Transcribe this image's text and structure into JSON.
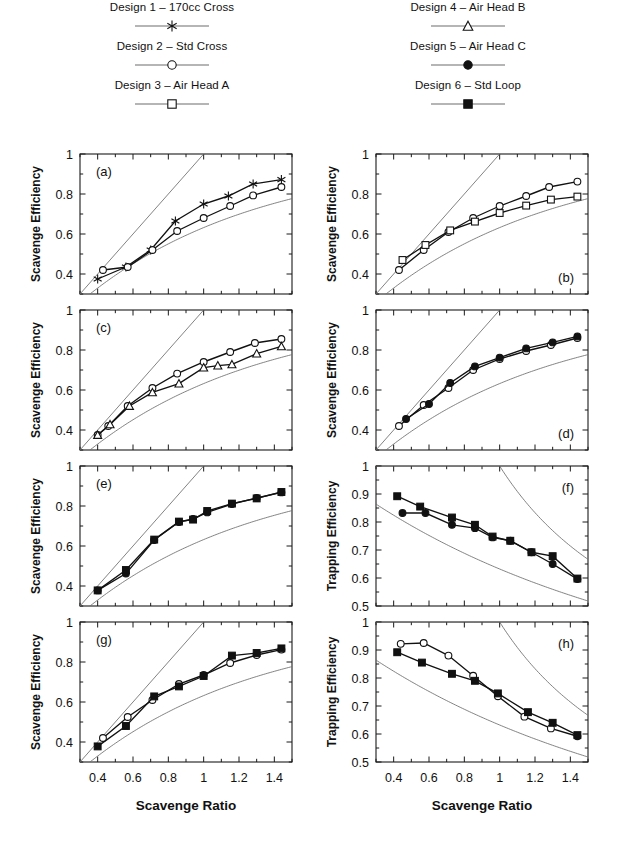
{
  "legend": {
    "left_entries": [
      {
        "label": "Design 1 – 170cc Cross",
        "marker": "star-icon"
      },
      {
        "label": "Design 2 – Std Cross",
        "marker": "open-circle-icon"
      },
      {
        "label": "Design 3 – Air Head A",
        "marker": "open-square-icon"
      }
    ],
    "right_entries": [
      {
        "label": "Design 4 – Air Head B",
        "marker": "open-triangle-icon"
      },
      {
        "label": "Design 5 – Air Head C",
        "marker": "filled-circle-icon"
      },
      {
        "label": "Design 6 – Std Loop",
        "marker": "filled-square-icon"
      }
    ]
  },
  "axes": {
    "x_title": "Scavenge Ratio",
    "y_title_scavenge": "Scavenge Efficiency",
    "y_title_trapping": "Trapping Efficiency",
    "x_ticklabels": [
      "0.4",
      "0.6",
      "0.8",
      "1",
      "1.2",
      "1.4"
    ],
    "x_tickvalues": [
      0.4,
      0.6,
      0.8,
      1.0,
      1.2,
      1.4
    ],
    "y_ticklabels_scavenge": [
      "0.4",
      "0.6",
      "0.8",
      "1"
    ],
    "y_tickvalues_scavenge": [
      0.4,
      0.6,
      0.8,
      1.0
    ],
    "y_ticklabels_trapping": [
      "0.5",
      "0.6",
      "0.7",
      "0.8",
      "0.9",
      "1"
    ],
    "y_tickvalues_trapping": [
      0.5,
      0.6,
      0.7,
      0.8,
      0.9,
      1.0
    ],
    "xlim": [
      0.3,
      1.5
    ],
    "ylim_scavenge": [
      0.3,
      1.0
    ],
    "ylim_trapping": [
      0.5,
      1.0
    ]
  },
  "colors": {
    "ink": "#111111",
    "reference_curve": "#6d6d6d",
    "background": "#ffffff"
  },
  "chart_data": {
    "type": "line",
    "title": "",
    "xlabel": "Scavenge Ratio",
    "panels": [
      {
        "tag": "(a)",
        "tag_pos": "top-left",
        "ylabel": "Scavenge Efficiency",
        "ylim": [
          0.3,
          1.0
        ],
        "xlim": [
          0.3,
          1.5
        ],
        "reference": [
          "perfect-displacement-line",
          "perfect-mixing-curve"
        ],
        "series": [
          {
            "name": "Design 1 – 170cc Cross",
            "marker": "star",
            "x": [
              0.4,
              0.56,
              0.7,
              0.84,
              1.0,
              1.14,
              1.28,
              1.44
            ],
            "y": [
              0.375,
              0.435,
              0.52,
              0.665,
              0.75,
              0.79,
              0.85,
              0.872
            ]
          },
          {
            "name": "Design 2 – Std Cross",
            "marker": "open-circle",
            "x": [
              0.43,
              0.57,
              0.71,
              0.85,
              1.0,
              1.15,
              1.28,
              1.44
            ],
            "y": [
              0.42,
              0.435,
              0.52,
              0.615,
              0.68,
              0.74,
              0.793,
              0.835
            ]
          }
        ]
      },
      {
        "tag": "(b)",
        "tag_pos": "bottom-right",
        "ylabel": "Scavenge Efficiency",
        "ylim": [
          0.3,
          1.0
        ],
        "xlim": [
          0.3,
          1.5
        ],
        "reference": [
          "perfect-displacement-line",
          "perfect-mixing-curve"
        ],
        "series": [
          {
            "name": "Design 2 – Std Cross",
            "marker": "open-circle",
            "x": [
              0.43,
              0.57,
              0.71,
              0.85,
              1.0,
              1.15,
              1.28,
              1.44
            ],
            "y": [
              0.42,
              0.52,
              0.61,
              0.68,
              0.74,
              0.79,
              0.835,
              0.862
            ]
          },
          {
            "name": "Design 3 – Air Head A",
            "marker": "open-square",
            "x": [
              0.45,
              0.58,
              0.72,
              0.86,
              1.0,
              1.15,
              1.29,
              1.44
            ],
            "y": [
              0.47,
              0.545,
              0.618,
              0.662,
              0.705,
              0.742,
              0.772,
              0.787
            ]
          }
        ]
      },
      {
        "tag": "(c)",
        "tag_pos": "top-left",
        "ylabel": "Scavenge Efficiency",
        "ylim": [
          0.3,
          1.0
        ],
        "xlim": [
          0.3,
          1.5
        ],
        "reference": [
          "perfect-displacement-line",
          "perfect-mixing-curve"
        ],
        "series": [
          {
            "name": "Design 2 – Std Cross",
            "marker": "open-circle",
            "x": [
              0.4,
              0.46,
              0.57,
              0.71,
              0.85,
              1.0,
              1.15,
              1.29,
              1.44
            ],
            "y": [
              0.375,
              0.42,
              0.52,
              0.61,
              0.682,
              0.74,
              0.79,
              0.835,
              0.855
            ]
          },
          {
            "name": "Design 4 – Air Head B",
            "marker": "open-triangle",
            "x": [
              0.4,
              0.47,
              0.58,
              0.71,
              0.86,
              1.0,
              1.08,
              1.16,
              1.3,
              1.44
            ],
            "y": [
              0.375,
              0.428,
              0.52,
              0.588,
              0.632,
              0.712,
              0.722,
              0.728,
              0.782,
              0.818
            ]
          }
        ]
      },
      {
        "tag": "(d)",
        "tag_pos": "bottom-right",
        "ylabel": "Scavenge Efficiency",
        "ylim": [
          0.3,
          1.0
        ],
        "xlim": [
          0.3,
          1.5
        ],
        "reference": [
          "perfect-displacement-line",
          "perfect-mixing-curve"
        ],
        "series": [
          {
            "name": "Design 2 – Std Cross",
            "marker": "open-circle",
            "x": [
              0.43,
              0.57,
              0.71,
              0.85,
              1.0,
              1.15,
              1.29,
              1.44
            ],
            "y": [
              0.42,
              0.525,
              0.61,
              0.7,
              0.755,
              0.795,
              0.825,
              0.86
            ]
          },
          {
            "name": "Design 5 – Air Head C",
            "marker": "filled-circle",
            "x": [
              0.47,
              0.6,
              0.72,
              0.86,
              1.0,
              1.15,
              1.3,
              1.44
            ],
            "y": [
              0.455,
              0.53,
              0.635,
              0.718,
              0.762,
              0.808,
              0.838,
              0.868
            ]
          }
        ]
      },
      {
        "tag": "(e)",
        "tag_pos": "top-left",
        "ylabel": "Scavenge Efficiency",
        "ylim": [
          0.3,
          1.0
        ],
        "xlim": [
          0.3,
          1.5
        ],
        "reference": [
          "perfect-displacement-line",
          "perfect-mixing-curve"
        ],
        "series": [
          {
            "name": "Design 5 – Air Head C",
            "marker": "filled-circle",
            "x": [
              0.4,
              0.56,
              0.72,
              0.86,
              0.94,
              1.02,
              1.16,
              1.3,
              1.44
            ],
            "y": [
              0.378,
              0.462,
              0.63,
              0.72,
              0.735,
              0.768,
              0.81,
              0.84,
              0.868
            ]
          },
          {
            "name": "Design 6 – Std Loop",
            "marker": "filled-square",
            "x": [
              0.4,
              0.56,
              0.72,
              0.86,
              0.94,
              1.02,
              1.16,
              1.3,
              1.44
            ],
            "y": [
              0.378,
              0.48,
              0.632,
              0.722,
              0.732,
              0.775,
              0.812,
              0.838,
              0.87
            ]
          }
        ]
      },
      {
        "tag": "(f)",
        "tag_pos": "top-right",
        "ylabel": "Trapping Efficiency",
        "ylim": [
          0.5,
          1.0
        ],
        "xlim": [
          0.3,
          1.5
        ],
        "reference": [
          "perfect-displacement-curve",
          "perfect-mixing-curve"
        ],
        "series": [
          {
            "name": "Design 5 – Air Head C",
            "marker": "filled-circle",
            "x": [
              0.45,
              0.58,
              0.73,
              0.86,
              0.96,
              1.06,
              1.18,
              1.3,
              1.44
            ],
            "y": [
              0.832,
              0.832,
              0.79,
              0.778,
              0.745,
              0.733,
              0.692,
              0.65,
              0.596
            ]
          },
          {
            "name": "Design 6 – Std Loop",
            "marker": "filled-square",
            "x": [
              0.42,
              0.55,
              0.73,
              0.86,
              0.96,
              1.06,
              1.18,
              1.3,
              1.44
            ],
            "y": [
              0.892,
              0.855,
              0.816,
              0.79,
              0.748,
              0.733,
              0.692,
              0.678,
              0.598
            ]
          }
        ]
      },
      {
        "tag": "(g)",
        "tag_pos": "top-left",
        "ylabel": "Scavenge Efficiency",
        "ylim": [
          0.3,
          1.0
        ],
        "xlim": [
          0.3,
          1.5
        ],
        "reference": [
          "perfect-displacement-line",
          "perfect-mixing-curve"
        ],
        "series": [
          {
            "name": "Design 2 – Std Cross",
            "marker": "open-circle",
            "x": [
              0.43,
              0.57,
              0.71,
              0.86,
              1.0,
              1.15,
              1.3,
              1.44
            ],
            "y": [
              0.42,
              0.525,
              0.61,
              0.69,
              0.735,
              0.795,
              0.835,
              0.862
            ]
          },
          {
            "name": "Design 6 – Std Loop",
            "marker": "filled-square",
            "x": [
              0.4,
              0.56,
              0.72,
              0.86,
              1.0,
              1.16,
              1.3,
              1.44
            ],
            "y": [
              0.378,
              0.48,
              0.628,
              0.678,
              0.73,
              0.832,
              0.845,
              0.868
            ]
          }
        ]
      },
      {
        "tag": "(h)",
        "tag_pos": "top-right",
        "ylabel": "Trapping Efficiency",
        "ylim": [
          0.5,
          1.0
        ],
        "xlim": [
          0.3,
          1.5
        ],
        "reference": [
          "perfect-displacement-curve",
          "perfect-mixing-curve"
        ],
        "series": [
          {
            "name": "Design 2 – Std Cross",
            "marker": "open-circle",
            "x": [
              0.44,
              0.57,
              0.71,
              0.85,
              0.99,
              1.14,
              1.29,
              1.44
            ],
            "y": [
              0.922,
              0.925,
              0.88,
              0.808,
              0.735,
              0.662,
              0.62,
              0.592
            ]
          },
          {
            "name": "Design 6 – Std Loop",
            "marker": "filled-square",
            "x": [
              0.42,
              0.56,
              0.73,
              0.86,
              0.99,
              1.16,
              1.3,
              1.44
            ],
            "y": [
              0.892,
              0.855,
              0.815,
              0.79,
              0.745,
              0.678,
              0.64,
              0.596
            ]
          }
        ]
      }
    ]
  }
}
